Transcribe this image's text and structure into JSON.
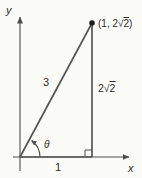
{
  "figure": {
    "type": "right-triangle-on-coordinate-axes",
    "axes": {
      "x_label": "x",
      "y_label": "y"
    },
    "point": {
      "prefix": "(1, 2√",
      "radicand": "2",
      "suffix": ")"
    },
    "sides": {
      "hypotenuse": "3",
      "vertical_prefix": "2√",
      "vertical_radicand": "2",
      "base": "1"
    },
    "angle": "θ"
  },
  "colors": {
    "line": "#4e4e4e",
    "triangle_line": "#565656",
    "text": "#2b2b2b",
    "background": "#fbfbf8"
  }
}
